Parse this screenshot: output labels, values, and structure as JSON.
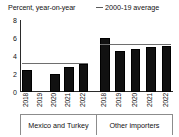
{
  "chart_data": {
    "type": "bar",
    "title": "Percent, year-on-year",
    "xlabel": "",
    "ylabel": "Percent, year-on-year",
    "ylim": [
      0,
      8
    ],
    "yticks": [
      0,
      2,
      4,
      6,
      8
    ],
    "ytick_labels": [
      "0",
      "2",
      "4",
      "6",
      "8"
    ],
    "grid": false,
    "legend_position": "top-right",
    "legend": [
      {
        "label": "2000-19 average",
        "marker": "line",
        "color": "#6e6e6e"
      }
    ],
    "bar_color": "#111111",
    "groups": [
      {
        "name": "Mexico and Turkey",
        "categories": [
          "2018",
          "2019",
          "2020",
          "2021",
          "2022"
        ],
        "values": [
          2.4,
          0.0,
          2.0,
          2.8,
          3.1
        ],
        "average_2000_19": 3.1
      },
      {
        "name": "Other importers",
        "categories": [
          "2018",
          "2019",
          "2020",
          "2021",
          "2022"
        ],
        "values": [
          6.0,
          4.6,
          4.8,
          5.0,
          5.1
        ],
        "average_2000_19": 5.2
      }
    ]
  },
  "header": {
    "axis_title": "Percent, year-on-year",
    "legend_label": "2000-19 average"
  },
  "axis": {
    "y_ticks": [
      "8",
      "6",
      "4",
      "2",
      "0"
    ]
  },
  "groups": {
    "left": {
      "caption": "Mexico and Turkey",
      "ticks": [
        "2018",
        "2019",
        "2020",
        "2021",
        "2022"
      ]
    },
    "right": {
      "caption": "Other importers",
      "ticks": [
        "2018",
        "2019",
        "2020",
        "2021",
        "2022"
      ]
    }
  }
}
